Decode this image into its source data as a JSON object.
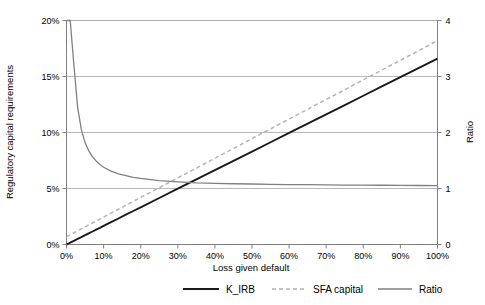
{
  "chart_data": {
    "type": "line",
    "title": "",
    "xlabel": "Loss given default",
    "ylabel": "Regulatory capital requirements",
    "y2label": "Ratio",
    "xlim": [
      0,
      100
    ],
    "ylim": [
      0,
      20
    ],
    "y2lim": [
      0,
      4
    ],
    "grid": true,
    "legend_position": "bottom",
    "xticks": [
      "0%",
      "10%",
      "20%",
      "30%",
      "40%",
      "50%",
      "60%",
      "70%",
      "80%",
      "90%",
      "100%"
    ],
    "xtick_values": [
      0,
      10,
      20,
      30,
      40,
      50,
      60,
      70,
      80,
      90,
      100
    ],
    "yticks": [
      "0%",
      "5%",
      "10%",
      "15%",
      "20%"
    ],
    "ytick_values": [
      0,
      5,
      10,
      15,
      20
    ],
    "y2ticks": [
      "0",
      "1",
      "2",
      "3",
      "4"
    ],
    "y2tick_values": [
      0,
      1,
      2,
      3,
      4
    ],
    "x": [
      0,
      1,
      2,
      3,
      4,
      5,
      6,
      7,
      8,
      9,
      10,
      12,
      14,
      16,
      18,
      20,
      25,
      30,
      35,
      40,
      45,
      50,
      55,
      60,
      65,
      70,
      75,
      80,
      85,
      90,
      95,
      100
    ],
    "series": [
      {
        "name": "K_IRB",
        "axis": "left",
        "style": "solid",
        "color": "#1a1a1a",
        "units": "percent",
        "values": [
          0.0,
          0.17,
          0.33,
          0.5,
          0.66,
          0.83,
          1.0,
          1.16,
          1.33,
          1.49,
          1.66,
          1.99,
          2.32,
          2.66,
          2.99,
          3.32,
          4.15,
          4.98,
          5.81,
          6.64,
          7.47,
          8.3,
          9.13,
          9.96,
          10.79,
          11.62,
          12.45,
          13.28,
          14.11,
          14.94,
          15.77,
          16.6
        ]
      },
      {
        "name": "SFA capital",
        "axis": "left",
        "style": "dashed",
        "color": "#b3b3b3",
        "units": "percent",
        "values": [
          0.7,
          0.87,
          1.05,
          1.22,
          1.4,
          1.57,
          1.75,
          1.92,
          2.1,
          2.27,
          2.45,
          2.8,
          3.15,
          3.5,
          3.85,
          4.2,
          5.07,
          5.95,
          6.82,
          7.7,
          8.57,
          9.45,
          10.32,
          11.2,
          12.07,
          12.95,
          13.82,
          14.7,
          15.57,
          16.45,
          17.32,
          18.2
        ]
      },
      {
        "name": "Ratio",
        "axis": "right",
        "style": "solid",
        "color": "#808080",
        "units": "ratio",
        "values": [
          4.0,
          4.0,
          3.2,
          2.45,
          2.05,
          1.82,
          1.67,
          1.57,
          1.49,
          1.43,
          1.38,
          1.31,
          1.26,
          1.23,
          1.2,
          1.18,
          1.14,
          1.12,
          1.1,
          1.09,
          1.085,
          1.08,
          1.075,
          1.07,
          1.068,
          1.065,
          1.062,
          1.06,
          1.058,
          1.056,
          1.054,
          1.052
        ]
      }
    ],
    "legend": [
      {
        "label": "K_IRB",
        "style": "solid",
        "color": "#1a1a1a"
      },
      {
        "label": "SFA capital",
        "style": "dashed",
        "color": "#b3b3b3"
      },
      {
        "label": "Ratio",
        "style": "solid",
        "color": "#808080"
      }
    ]
  }
}
